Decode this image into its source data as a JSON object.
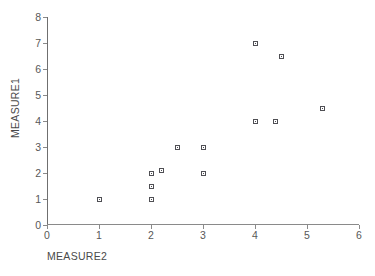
{
  "chart_data": {
    "type": "scatter",
    "title": "",
    "xlabel": "MEASURE2",
    "ylabel": "MEASURE1",
    "xlim": [
      0,
      6
    ],
    "ylim": [
      0,
      8
    ],
    "xticks": [
      "0",
      "1",
      "2",
      "3",
      "4",
      "5",
      "6"
    ],
    "yticks": [
      "0",
      "1",
      "2",
      "3",
      "4",
      "5",
      "6",
      "7",
      "8"
    ],
    "xtick_values": [
      0,
      1,
      2,
      3,
      4,
      5,
      6
    ],
    "ytick_values": [
      0,
      1,
      2,
      3,
      4,
      5,
      6,
      7,
      8
    ],
    "grid": false,
    "legend": false,
    "marker_style": "open-square",
    "marker_color": "#4f4f54",
    "series": [
      {
        "name": "MEASURE1 vs MEASURE2",
        "points": [
          {
            "x": 1.0,
            "y": 1.0
          },
          {
            "x": 2.0,
            "y": 1.0
          },
          {
            "x": 2.0,
            "y": 1.5
          },
          {
            "x": 2.0,
            "y": 2.0
          },
          {
            "x": 2.2,
            "y": 2.1
          },
          {
            "x": 2.5,
            "y": 3.0
          },
          {
            "x": 3.0,
            "y": 2.0
          },
          {
            "x": 3.0,
            "y": 3.0
          },
          {
            "x": 4.0,
            "y": 4.0
          },
          {
            "x": 4.0,
            "y": 7.0
          },
          {
            "x": 4.4,
            "y": 4.0
          },
          {
            "x": 4.5,
            "y": 6.5
          },
          {
            "x": 5.3,
            "y": 4.5
          }
        ]
      }
    ]
  },
  "axis_titles": {
    "x": "MEASURE2",
    "y": "MEASURE1"
  }
}
